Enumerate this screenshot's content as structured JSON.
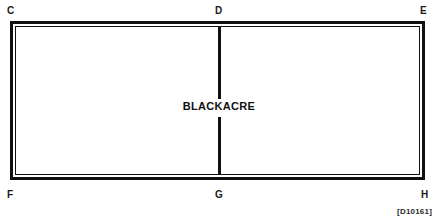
{
  "figure": {
    "kind": "property-plat-diagram",
    "parcel_name": "BLACKACRE",
    "reference_code": "[D10161]",
    "ink_color": "#111111",
    "background_color": "#ffffff"
  },
  "vertices": [
    {
      "id": "C",
      "label": "C",
      "position": "top-left"
    },
    {
      "id": "D",
      "label": "D",
      "position": "top-center"
    },
    {
      "id": "E",
      "label": "E",
      "position": "top-right"
    },
    {
      "id": "F",
      "label": "F",
      "position": "bottom-left"
    },
    {
      "id": "G",
      "label": "G",
      "position": "bottom-center"
    },
    {
      "id": "H",
      "label": "H",
      "position": "bottom-right"
    }
  ],
  "divider": {
    "from": "D",
    "to": "G",
    "upper_segment_label": "",
    "lower_segment_label": ""
  }
}
